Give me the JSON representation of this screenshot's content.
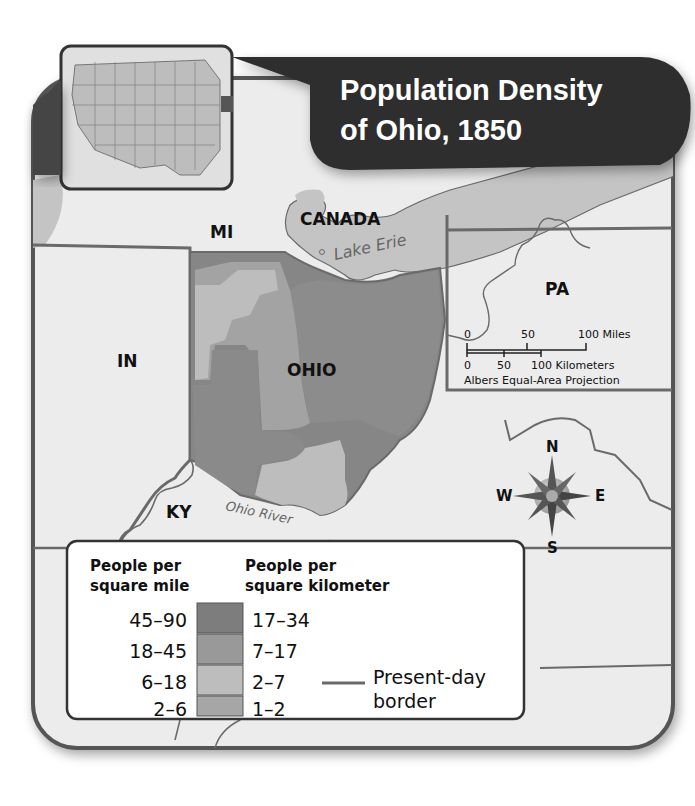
{
  "title": {
    "line1": "Population Density",
    "line2": "of Ohio, 1850"
  },
  "locator_map": {
    "description": "United States locator map with Ohio highlighted"
  },
  "map_labels": {
    "mi": "MI",
    "canada": "CANADA",
    "lake_erie": "Lake Erie",
    "pa": "PA",
    "in": "IN",
    "ohio": "OHIO",
    "ky": "KY",
    "ohio_river": "Ohio River"
  },
  "scale_bar": {
    "miles_ticks": [
      "0",
      "50",
      "100 Miles"
    ],
    "km_ticks": [
      "0",
      "50",
      "100 Kilometers"
    ],
    "projection": "Albers Equal-Area Projection"
  },
  "compass": {
    "n": "N",
    "s": "S",
    "e": "E",
    "w": "W"
  },
  "legend": {
    "col1_header_line1": "People per",
    "col1_header_line2": "square mile",
    "col2_header_line1": "People per",
    "col2_header_line2": "square kilometer",
    "rows": [
      {
        "per_mile": "45–90",
        "per_km": "17–34",
        "color": "#7d7d7d"
      },
      {
        "per_mile": "18–45",
        "per_km": "7–17",
        "color": "#999999"
      },
      {
        "per_mile": "6–18",
        "per_km": "2–7",
        "color": "#bdbdbd"
      },
      {
        "per_mile": "2–6",
        "per_km": "1–2",
        "color": "#a6a6a6"
      }
    ],
    "border_line_label1": "Present-day",
    "border_line_label2": "border"
  },
  "colors": {
    "title_bg": "#2e2e2e",
    "frame": "#555555",
    "land": "#ececec",
    "water": "#c4c4c4",
    "border_line": "#6a6a6a"
  }
}
